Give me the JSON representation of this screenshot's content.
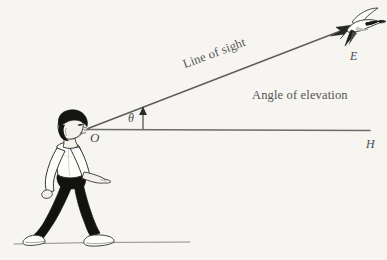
{
  "figure": {
    "background_color": "#f6f5f2",
    "ink_color": "#55544f",
    "labels": {
      "observer_point": "O",
      "horizon_point": "H",
      "object_point": "E",
      "angle_symbol": "θ",
      "line_of_sight": "Line of sight",
      "angle_of_elevation": "Angle of elevation"
    },
    "geometry": {
      "observer_xy": [
        88,
        129
      ],
      "horizon_end_xy": [
        370,
        130
      ],
      "sight_end_xy": [
        350,
        27
      ],
      "angle_tick_x": 143,
      "ground_line_y": 243,
      "ground_line_x_range": [
        14,
        190
      ]
    },
    "icons": {
      "bird": "bird-icon",
      "person": "walking-person-icon",
      "sight_arrow": "arrowhead-icon",
      "angle_arrow": "up-arrow-icon"
    },
    "colors": {
      "line": "#6d6c67",
      "dark": "#171717",
      "shirt": "#fdfdfb",
      "skin": "#f3efe9",
      "ground": "#8c8b86"
    }
  }
}
